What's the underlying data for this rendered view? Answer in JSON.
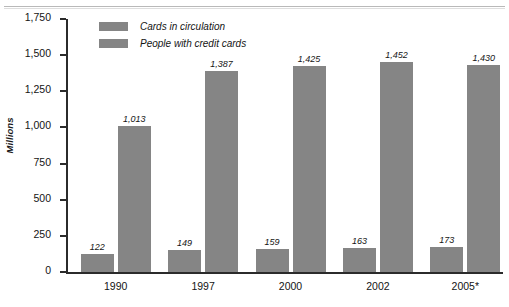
{
  "chart_data": {
    "type": "bar",
    "title": "",
    "subtitle": "",
    "xlabel": "",
    "ylabel": "Millions",
    "categories": [
      "1990",
      "1997",
      "2000",
      "2002",
      "2005*"
    ],
    "series": [
      {
        "name": "Cards in circulation",
        "values": [
          122,
          149,
          159,
          163,
          173
        ],
        "labels": [
          "122",
          "149",
          "159",
          "163",
          "173"
        ],
        "color": "#858585"
      },
      {
        "name": "People with credit cards",
        "values": [
          1013,
          1387,
          1425,
          1452,
          1430
        ],
        "labels": [
          "1,013",
          "1,387",
          "1,425",
          "1,452",
          "1,430"
        ],
        "color": "#858585"
      }
    ],
    "ylim": [
      0,
      1750
    ],
    "yticks": [
      0,
      250,
      500,
      750,
      1000,
      1250,
      1500,
      1750
    ],
    "ytick_labels": [
      "0",
      "250",
      "500",
      "750",
      "1,000",
      "1,250",
      "1,500",
      "1,750"
    ],
    "grid": false,
    "legend_position": "top-left"
  }
}
